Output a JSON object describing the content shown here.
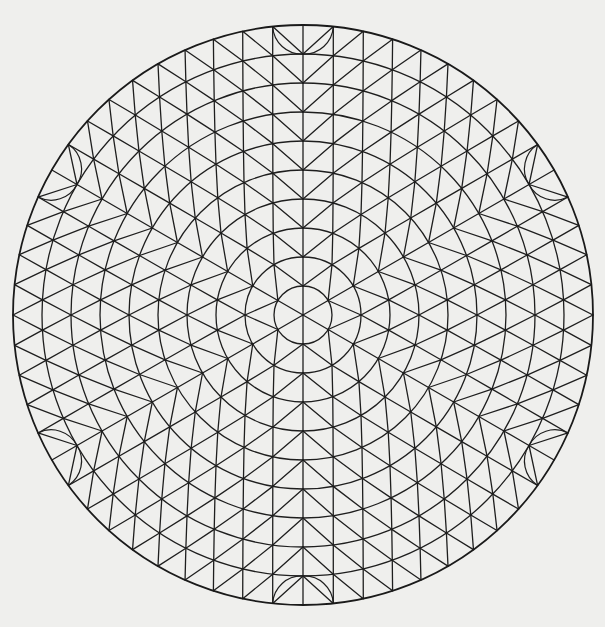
{
  "diagram": {
    "title": "Geodesic circular triangulated mesh",
    "type": "hexagonal-disc-triangulation",
    "center": [
      303,
      315
    ],
    "ring_count": 10,
    "ring_spacing": 29,
    "nodes_per_ring_rule": "6k",
    "orientation": "vertex-up",
    "symmetry": 6,
    "edge_lenses": {
      "description": "small lens-shaped arc pairs at outer rim cells",
      "angles_deg": [
        90,
        150,
        210,
        270,
        330,
        30
      ]
    },
    "colors": {
      "background": "#efefed",
      "line": "#1e1e1e"
    }
  }
}
